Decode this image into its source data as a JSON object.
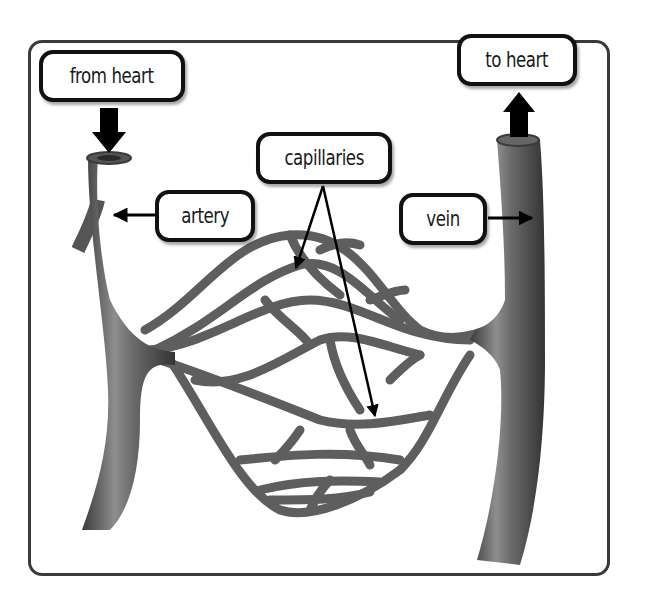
{
  "diagram": {
    "labels": {
      "from_heart": "from heart",
      "to_heart": "to heart",
      "artery": "artery",
      "vein": "vein",
      "capillaries": "capillaries"
    },
    "arrows": [
      {
        "from": "from heart",
        "to": "artery top",
        "direction": "down"
      },
      {
        "from": "vein top",
        "to": "to heart",
        "direction": "up"
      },
      {
        "from": "artery label",
        "to": "artery",
        "direction": "left"
      },
      {
        "from": "vein label",
        "to": "vein",
        "direction": "right"
      },
      {
        "from": "capillaries label",
        "to": "capillary network (upper)",
        "direction": "down-left"
      },
      {
        "from": "capillaries label",
        "to": "capillary network (lower)",
        "direction": "down-right"
      }
    ],
    "colors": {
      "vessel": "#6a6a6a",
      "vessel_highlight": "#9a9a9a",
      "vessel_dark": "#3c3c3c",
      "frame": "#3a3a3a",
      "label_border": "#111111"
    }
  }
}
